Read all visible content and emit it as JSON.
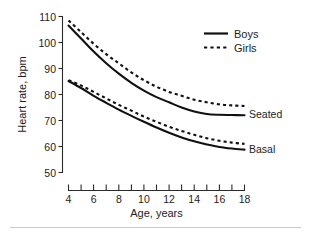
{
  "chart_data": {
    "type": "line",
    "title": "",
    "subtitle": "",
    "xlabel": "Age, years",
    "ylabel": "Heart rate, bpm",
    "xlim": [
      4,
      18
    ],
    "ylim": [
      50,
      110
    ],
    "xticks": [
      4,
      5,
      6,
      7,
      8,
      9,
      10,
      11,
      12,
      13,
      14,
      15,
      16,
      17,
      18
    ],
    "xticklabels": [
      "4",
      "",
      "6",
      "",
      "8",
      "",
      "10",
      "",
      "12",
      "",
      "14",
      "",
      "16",
      "",
      "18"
    ],
    "yticks": [
      50,
      60,
      70,
      80,
      90,
      100,
      110
    ],
    "yticklabels": [
      "50",
      "60",
      "70",
      "80",
      "90",
      "100",
      "110"
    ],
    "grid": false,
    "legend_position": "top-right",
    "legend": [
      {
        "name": "Boys",
        "style": "solid"
      },
      {
        "name": "Girls",
        "style": "dashed"
      }
    ],
    "group_labels": [
      {
        "name": "Seated",
        "value_at_18": 72
      },
      {
        "name": "Basal",
        "value_at_18": 59
      }
    ],
    "x": [
      4,
      5,
      6,
      7,
      8,
      9,
      10,
      11,
      12,
      13,
      14,
      15,
      16,
      17,
      18
    ],
    "series": [
      {
        "name": "Seated Boys",
        "group": "Seated",
        "sex": "Boys",
        "style": "solid",
        "values": [
          106.5,
          101.5,
          96.5,
          92.0,
          88.0,
          84.5,
          81.5,
          79.0,
          77.0,
          75.0,
          73.5,
          72.5,
          72.2,
          72.1,
          72.0
        ]
      },
      {
        "name": "Seated Girls",
        "group": "Seated",
        "sex": "Girls",
        "style": "dashed",
        "values": [
          108.5,
          104.0,
          99.5,
          95.5,
          92.0,
          88.5,
          85.5,
          83.0,
          81.0,
          79.5,
          78.0,
          77.0,
          76.2,
          75.8,
          75.6
        ]
      },
      {
        "name": "Basal Boys",
        "group": "Basal",
        "sex": "Boys",
        "style": "solid",
        "values": [
          85.2,
          82.5,
          79.5,
          76.8,
          74.2,
          71.8,
          69.5,
          67.3,
          65.3,
          63.5,
          62.0,
          60.8,
          59.8,
          59.2,
          58.8
        ]
      },
      {
        "name": "Basal Girls",
        "group": "Basal",
        "sex": "Girls",
        "style": "dashed",
        "values": [
          85.5,
          83.5,
          81.0,
          78.5,
          76.0,
          73.8,
          71.5,
          69.5,
          67.6,
          66.0,
          64.5,
          63.2,
          62.2,
          61.5,
          61.0
        ]
      }
    ]
  },
  "axes": {
    "y_axis_title": "Heart rate, bpm",
    "x_axis_title": "Age, years"
  },
  "labels": {
    "y_50": "50",
    "y_60": "60",
    "y_70": "70",
    "y_80": "80",
    "y_90": "90",
    "y_100": "100",
    "y_110": "110",
    "x_4": "4",
    "x_6": "6",
    "x_8": "8",
    "x_10": "10",
    "x_12": "12",
    "x_14": "14",
    "x_16": "16",
    "x_18": "18",
    "legend_boys": "Boys",
    "legend_girls": "Girls",
    "group_seated": "Seated",
    "group_basal": "Basal"
  },
  "colors": {
    "background": "#ffffff",
    "ink": "#111111",
    "axis": "#2b2b2b",
    "rule": "#c8c8c8"
  }
}
